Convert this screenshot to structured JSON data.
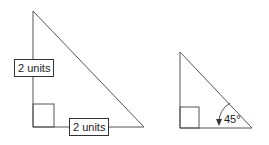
{
  "diagram": {
    "left_triangle": {
      "vertical_leg_label": "2 units",
      "horizontal_leg_label": "2 units",
      "right_angle_marker": true
    },
    "right_triangle": {
      "angle_label": "45°",
      "right_angle_marker": true
    },
    "colors": {
      "line": "#555555",
      "text": "#222222",
      "background": "#ffffff"
    }
  }
}
